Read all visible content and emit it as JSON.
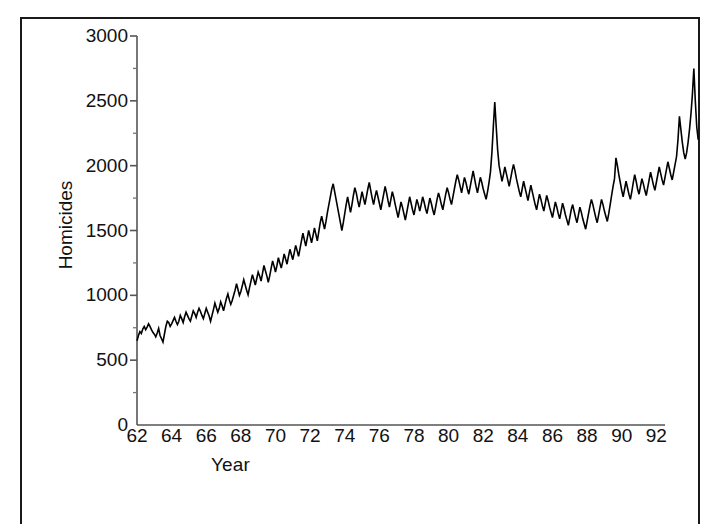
{
  "chart_data": {
    "type": "line",
    "title": "",
    "xlabel": "Year",
    "ylabel": "Homicides",
    "xlim": [
      62,
      92.5
    ],
    "ylim": [
      0,
      3000
    ],
    "grid": false,
    "legend": null,
    "x_tick_labels": [
      "62",
      "64",
      "66",
      "68",
      "70",
      "72",
      "74",
      "76",
      "78",
      "80",
      "82",
      "84",
      "86",
      "88",
      "90",
      "92"
    ],
    "x_tick_values": [
      62,
      64,
      66,
      68,
      70,
      72,
      74,
      76,
      78,
      80,
      82,
      84,
      86,
      88,
      90,
      92
    ],
    "y_tick_labels": [
      "0",
      "500",
      "1000",
      "1500",
      "2000",
      "2500",
      "3000"
    ],
    "y_tick_values": [
      0,
      500,
      1000,
      1500,
      2000,
      2500,
      3000
    ],
    "y_minor_tick_values": [
      250,
      750,
      1250,
      1750,
      2250,
      2750
    ],
    "line_color": "#000000",
    "line_width": 1.6,
    "series_name": "Homicides",
    "x_start": 62.0,
    "x_step": 0.08333333,
    "values": [
      650,
      690,
      720,
      705,
      740,
      760,
      735,
      755,
      780,
      760,
      735,
      715,
      700,
      680,
      710,
      745,
      690,
      665,
      640,
      700,
      760,
      800,
      790,
      760,
      780,
      805,
      830,
      800,
      775,
      800,
      845,
      820,
      790,
      835,
      870,
      845,
      820,
      800,
      840,
      880,
      860,
      830,
      870,
      900,
      875,
      845,
      820,
      860,
      900,
      870,
      840,
      800,
      845,
      890,
      940,
      905,
      870,
      900,
      950,
      920,
      880,
      930,
      975,
      1010,
      965,
      930,
      960,
      1000,
      1040,
      1090,
      1045,
      1000,
      1030,
      1075,
      1120,
      1080,
      1040,
      1005,
      1060,
      1110,
      1160,
      1120,
      1080,
      1130,
      1180,
      1150,
      1110,
      1170,
      1230,
      1190,
      1150,
      1100,
      1150,
      1210,
      1265,
      1225,
      1180,
      1230,
      1290,
      1250,
      1210,
      1260,
      1320,
      1280,
      1240,
      1300,
      1355,
      1315,
      1275,
      1330,
      1385,
      1345,
      1300,
      1360,
      1420,
      1480,
      1430,
      1380,
      1440,
      1500,
      1455,
      1405,
      1460,
      1520,
      1470,
      1420,
      1490,
      1560,
      1610,
      1560,
      1510,
      1570,
      1640,
      1700,
      1760,
      1820,
      1860,
      1800,
      1740,
      1680,
      1620,
      1560,
      1500,
      1560,
      1630,
      1700,
      1760,
      1700,
      1640,
      1700,
      1770,
      1830,
      1790,
      1730,
      1680,
      1740,
      1800,
      1750,
      1700,
      1760,
      1820,
      1870,
      1810,
      1750,
      1700,
      1760,
      1810,
      1760,
      1710,
      1660,
      1720,
      1780,
      1840,
      1790,
      1730,
      1680,
      1740,
      1800,
      1755,
      1700,
      1650,
      1600,
      1660,
      1720,
      1680,
      1630,
      1580,
      1640,
      1700,
      1760,
      1710,
      1660,
      1620,
      1680,
      1740,
      1700,
      1650,
      1700,
      1760,
      1720,
      1670,
      1630,
      1690,
      1750,
      1710,
      1660,
      1620,
      1680,
      1740,
      1790,
      1750,
      1700,
      1660,
      1720,
      1780,
      1830,
      1790,
      1740,
      1700,
      1760,
      1820,
      1880,
      1930,
      1890,
      1840,
      1790,
      1850,
      1910,
      1870,
      1820,
      1780,
      1840,
      1900,
      1960,
      1900,
      1840,
      1790,
      1850,
      1910,
      1870,
      1820,
      1780,
      1740,
      1800,
      1870,
      1950,
      2100,
      2300,
      2490,
      2300,
      2120,
      2000,
      1940,
      1880,
      1930,
      1990,
      1940,
      1890,
      1840,
      1900,
      1960,
      2010,
      1960,
      1900,
      1850,
      1800,
      1760,
      1820,
      1880,
      1830,
      1780,
      1730,
      1790,
      1850,
      1800,
      1750,
      1700,
      1660,
      1720,
      1780,
      1740,
      1690,
      1650,
      1710,
      1770,
      1730,
      1680,
      1640,
      1600,
      1660,
      1720,
      1680,
      1630,
      1590,
      1650,
      1710,
      1670,
      1620,
      1580,
      1540,
      1600,
      1660,
      1700,
      1650,
      1600,
      1560,
      1620,
      1680,
      1640,
      1590,
      1550,
      1510,
      1570,
      1630,
      1690,
      1740,
      1700,
      1650,
      1600,
      1560,
      1620,
      1680,
      1740,
      1700,
      1650,
      1610,
      1570,
      1630,
      1700,
      1770,
      1840,
      1900,
      2060,
      2000,
      1930,
      1870,
      1810,
      1760,
      1820,
      1880,
      1830,
      1780,
      1740,
      1800,
      1870,
      1930,
      1880,
      1820,
      1780,
      1840,
      1900,
      1860,
      1810,
      1770,
      1830,
      1890,
      1950,
      1900,
      1850,
      1810,
      1870,
      1930,
      1990,
      1940,
      1890,
      1850,
      1910,
      1970,
      2030,
      1980,
      1930,
      1890,
      1950,
      2010,
      2070,
      2200,
      2380,
      2280,
      2180,
      2100,
      2050,
      2100,
      2180,
      2280,
      2400,
      2550,
      2750,
      2500,
      2300,
      2200
    ]
  }
}
